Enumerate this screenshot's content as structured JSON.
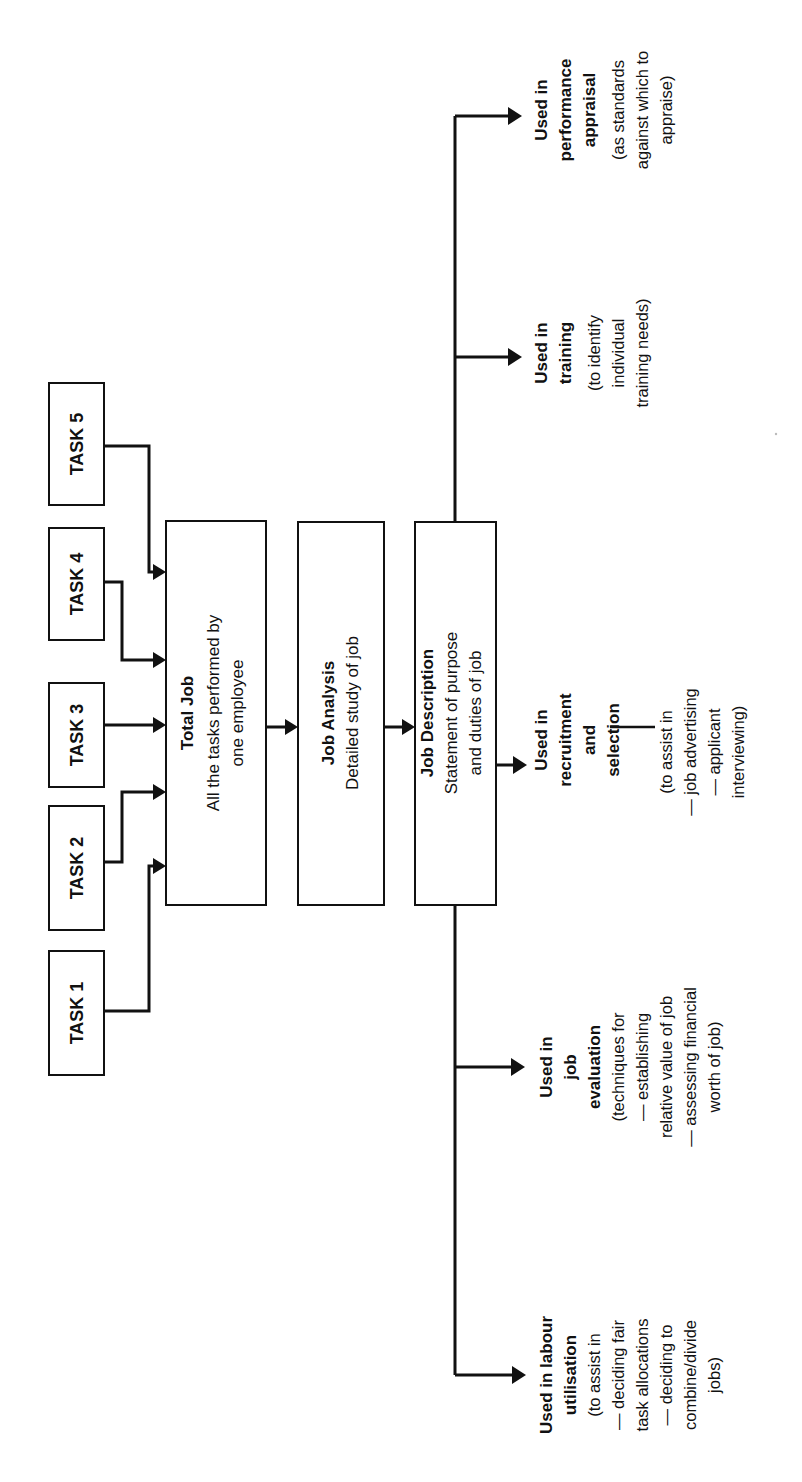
{
  "diagram": {
    "orientation": "rotated 90° counter-clockwise (reads bottom-to-top)",
    "colors": {
      "stroke": "#111111",
      "background": "#ffffff"
    },
    "tasks": [
      {
        "id": "task1",
        "label": "TASK 1"
      },
      {
        "id": "task2",
        "label": "TASK 2"
      },
      {
        "id": "task3",
        "label": "TASK 3"
      },
      {
        "id": "task4",
        "label": "TASK 4"
      },
      {
        "id": "task5",
        "label": "TASK 5"
      }
    ],
    "total_job": {
      "title": "Total Job",
      "line1": "All the tasks performed by",
      "line2": "one employee"
    },
    "job_analysis": {
      "title": "Job Analysis",
      "line1": "Detailed study of job"
    },
    "job_description": {
      "title": "Job Description",
      "line1": "Statement of purpose",
      "line2": "and duties of job"
    },
    "uses": {
      "performance": {
        "title": [
          "Used in",
          "performance",
          "appraisal"
        ],
        "body": [
          "(as standards",
          "against which to",
          "appraise)"
        ]
      },
      "training": {
        "title": [
          "Used in",
          "training"
        ],
        "body": [
          "(to identify",
          "individual",
          "training needs)"
        ]
      },
      "recruitment": {
        "title": [
          "Used in",
          "recruitment",
          "and",
          "selection"
        ],
        "body": [
          "(to assist in",
          "— job advertising",
          "— applicant",
          "interviewing)"
        ]
      },
      "evaluation": {
        "title": [
          "Used in",
          "job",
          "evaluation"
        ],
        "body": [
          "(techniques for",
          "— establishing",
          "relative value of job",
          "— assessing financial",
          "worth of job)"
        ]
      },
      "labour": {
        "title": [
          "Used in labour",
          "utilisation"
        ],
        "body": [
          "(to assist in",
          "— deciding fair",
          "task allocations",
          "— deciding to",
          "combine/divide",
          "jobs)"
        ]
      }
    }
  }
}
